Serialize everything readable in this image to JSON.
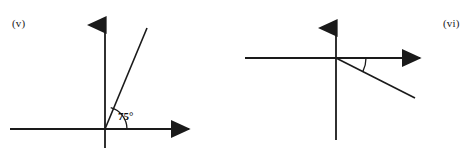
{
  "page": {
    "width": 462,
    "height": 157,
    "background_color": "#ffffff",
    "ink_color": "#1a1a1a"
  },
  "figures": [
    {
      "id": "v",
      "label": "(v)",
      "angle_label": "75°",
      "angle_degrees": 75,
      "origin": {
        "x": 105,
        "y": 129
      },
      "vertical_axis": {
        "top_y": 15,
        "bottom_y": 148,
        "arrow": "up"
      },
      "horizontal_axis": {
        "left_x": 10,
        "right_x": 197,
        "arrow": "right"
      },
      "ray": {
        "end_x": 147,
        "end_y": 28,
        "direction": "up-right",
        "arrow": "none"
      },
      "arc_radius": 22
    },
    {
      "id": "vi",
      "label": "(vi)",
      "angle_label": "30°",
      "angle_degrees": 30,
      "origin": {
        "x": 336,
        "y": 58
      },
      "vertical_axis": {
        "top_y": 18,
        "bottom_y": 140,
        "arrow": "up"
      },
      "horizontal_axis": {
        "left_x": 245,
        "right_x": 428,
        "arrow": "right"
      },
      "ray": {
        "end_x": 415,
        "end_y": 98,
        "direction": "down-right",
        "arrow": "none"
      },
      "arc_radius": 30
    }
  ]
}
